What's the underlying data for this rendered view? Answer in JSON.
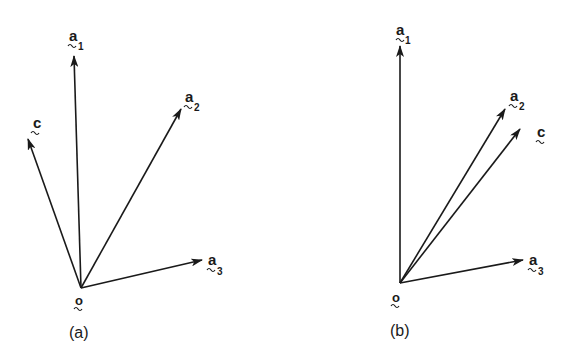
{
  "figure": {
    "panels": [
      {
        "id": "a",
        "caption": "(a)",
        "origin": {
          "label": "o",
          "x": 81,
          "y": 288
        },
        "vectors": [
          {
            "name": "a1",
            "base": "a",
            "subscript": "1",
            "tip": [
              74,
              55
            ]
          },
          {
            "name": "a2",
            "base": "a",
            "subscript": "2",
            "tip": [
              182,
              108
            ]
          },
          {
            "name": "a3",
            "base": "a",
            "subscript": "3",
            "tip": [
              203,
              260
            ]
          },
          {
            "name": "c",
            "base": "c",
            "subscript": "",
            "tip": [
              27,
              138
            ]
          }
        ],
        "note": "c lies outside the cone spanned by a1, a2, a3"
      },
      {
        "id": "b",
        "caption": "(b)",
        "origin": {
          "label": "o",
          "x": 400,
          "y": 283
        },
        "vectors": [
          {
            "name": "a1",
            "base": "a",
            "subscript": "1",
            "tip": [
              400,
              45
            ]
          },
          {
            "name": "a2",
            "base": "a",
            "subscript": "2",
            "tip": [
              506,
              108
            ]
          },
          {
            "name": "a3",
            "base": "a",
            "subscript": "3",
            "tip": [
              524,
              260
            ]
          },
          {
            "name": "c",
            "base": "c",
            "subscript": "",
            "tip": [
              521,
              128
            ]
          }
        ],
        "note": "c lies inside the cone spanned by a1, a2, a3"
      }
    ],
    "stroke_color": "#1a1a1a",
    "background": "#ffffff"
  },
  "labels": {
    "a_base": "a",
    "c_base": "c",
    "o_base": "o",
    "sub1": "1",
    "sub2": "2",
    "sub3": "3",
    "caption_a": "(a)",
    "caption_b": "(b)"
  }
}
